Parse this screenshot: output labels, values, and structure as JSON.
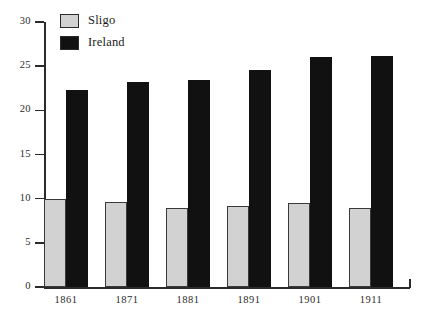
{
  "chart_data": {
    "type": "bar",
    "title": "",
    "xlabel": "",
    "ylabel": "",
    "categories": [
      "1861",
      "1871",
      "1881",
      "1891",
      "1901",
      "1911"
    ],
    "series": [
      {
        "name": "Sligo",
        "color": "#d2d2d2",
        "values": [
          10.0,
          9.6,
          9.0,
          9.2,
          9.5,
          8.9
        ]
      },
      {
        "name": "Ireland",
        "color": "#111111",
        "values": [
          22.3,
          23.2,
          23.4,
          24.6,
          26.0,
          26.1
        ]
      }
    ],
    "ylim": [
      0,
      30
    ],
    "yticks": [
      0,
      5,
      10,
      15,
      20,
      25,
      30
    ],
    "ytick_labels": [
      "0",
      "5",
      "10",
      "15",
      "20",
      "25",
      "30"
    ],
    "grid": false,
    "legend_position": "top-left"
  },
  "legend": {
    "entries": [
      {
        "label": "Sligo",
        "swatch": "swatch-sligo"
      },
      {
        "label": "Ireland",
        "swatch": "swatch-ireland"
      }
    ]
  }
}
